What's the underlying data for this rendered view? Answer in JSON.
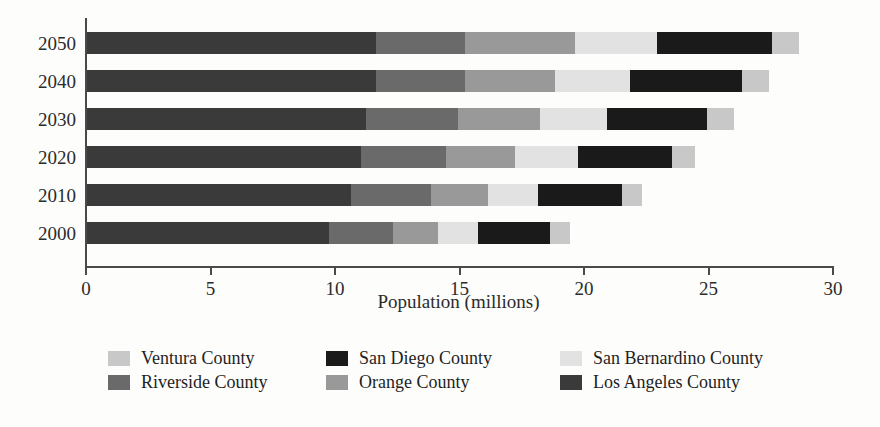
{
  "chart_data": {
    "type": "bar",
    "orientation": "horizontal",
    "stacked": true,
    "title": "",
    "subtitle": "",
    "xlabel": "Population (millions)",
    "ylabel": "",
    "xlim": [
      0,
      30
    ],
    "xticks": [
      0,
      5,
      10,
      15,
      20,
      25,
      30
    ],
    "xtick_labels": [
      "0",
      "5",
      "10",
      "15",
      "20",
      "25",
      "30"
    ],
    "grid": false,
    "legend_position": "bottom",
    "categories": [
      "2000",
      "2010",
      "2020",
      "2030",
      "2040",
      "2050"
    ],
    "category_order_top_to_bottom": [
      "2050",
      "2040",
      "2030",
      "2020",
      "2010",
      "2000"
    ],
    "series": [
      {
        "name": "Los Angeles County",
        "color": "#3a3a3a",
        "values": [
          9.7,
          10.6,
          11.0,
          11.2,
          11.6,
          11.6
        ]
      },
      {
        "name": "Riverside County",
        "color": "#6a6a6a",
        "values": [
          2.6,
          3.2,
          3.4,
          3.7,
          3.6,
          3.6
        ]
      },
      {
        "name": "Orange County",
        "color": "#999999",
        "values": [
          1.8,
          2.3,
          2.8,
          3.3,
          3.6,
          4.4
        ]
      },
      {
        "name": "San Bernardino County",
        "color": "#e2e2e2",
        "values": [
          1.6,
          2.0,
          2.5,
          2.7,
          3.0,
          3.3
        ]
      },
      {
        "name": "San Diego County",
        "color": "#1a1a1a",
        "values": [
          2.9,
          3.4,
          3.8,
          4.0,
          4.5,
          4.6
        ]
      },
      {
        "name": "Ventura County",
        "color": "#c8c8c8",
        "values": [
          0.8,
          0.8,
          0.9,
          1.1,
          1.1,
          1.1
        ]
      }
    ],
    "totals": [
      19.4,
      22.3,
      24.4,
      26.0,
      27.4,
      28.6
    ],
    "stack_order_left_to_right": [
      "Los Angeles County",
      "Riverside County",
      "Orange County",
      "San Bernardino County",
      "San Diego County",
      "Ventura County"
    ]
  },
  "axis": {
    "x_title": "Population (millions)",
    "tick_labels": [
      "0",
      "5",
      "10",
      "15",
      "20",
      "25",
      "30"
    ],
    "year_labels": [
      "2050",
      "2040",
      "2030",
      "2020",
      "2010",
      "2000"
    ]
  },
  "legend": {
    "columns": [
      {
        "entries": [
          {
            "label": "Ventura County",
            "color": "#c8c8c8"
          },
          {
            "label": "Riverside County",
            "color": "#6a6a6a"
          }
        ]
      },
      {
        "entries": [
          {
            "label": "San Diego County",
            "color": "#1a1a1a"
          },
          {
            "label": "Orange County",
            "color": "#999999"
          }
        ]
      },
      {
        "entries": [
          {
            "label": "San Bernardino County",
            "color": "#e2e2e2"
          },
          {
            "label": "Los Angeles County",
            "color": "#3a3a3a"
          }
        ]
      }
    ]
  }
}
